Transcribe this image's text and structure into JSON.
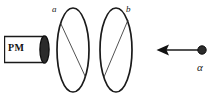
{
  "figure": {
    "background_color": "#ffffff",
    "stroke_color": "#1a1a1a",
    "fill_color": "#2b2b2b"
  },
  "detector": {
    "label": "PM",
    "description": "photomultiplier tube",
    "window_shape": "filled-ellipse-cap"
  },
  "rings": [
    {
      "label": "a",
      "description": "first ring detector with diagonal chord",
      "center_x": 73,
      "center_y": 50,
      "radius_x": 16,
      "radius_y": 42
    },
    {
      "label": "b",
      "description": "second ring detector with diagonal chord",
      "center_x": 116,
      "center_y": 50,
      "radius_x": 16,
      "radius_y": 42
    }
  ],
  "particle": {
    "label": "α",
    "description": "alpha particle travelling to the left",
    "direction": "left",
    "marker": "filled-circle",
    "arrow_from_x": 203,
    "arrow_to_x": 158,
    "arrow_y": 50
  },
  "colors": {
    "ink": "#1a1a1a",
    "fill": "#2b2b2b",
    "paper": "#ffffff"
  }
}
